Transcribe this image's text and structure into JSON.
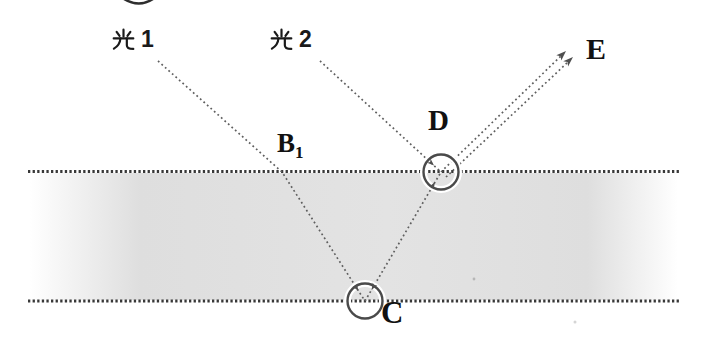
{
  "figure": {
    "kind": "optics-ray-diagram",
    "medium": "glass-slab"
  },
  "labels": {
    "ray1_label": "光 1",
    "ray1_number": "1",
    "ray2_label": "光 2",
    "ray2_number": "2",
    "point_b": "B",
    "point_b_subscript": "1",
    "point_c": "C",
    "point_d": "D",
    "point_e": "E"
  },
  "colors": {
    "background": "#ffffff",
    "slab_gray": "#dedede",
    "surface_line": "#383838",
    "ray_line": "#5f5f5f",
    "circle_stroke": "#4a4a4a",
    "label_text": "#111111"
  }
}
